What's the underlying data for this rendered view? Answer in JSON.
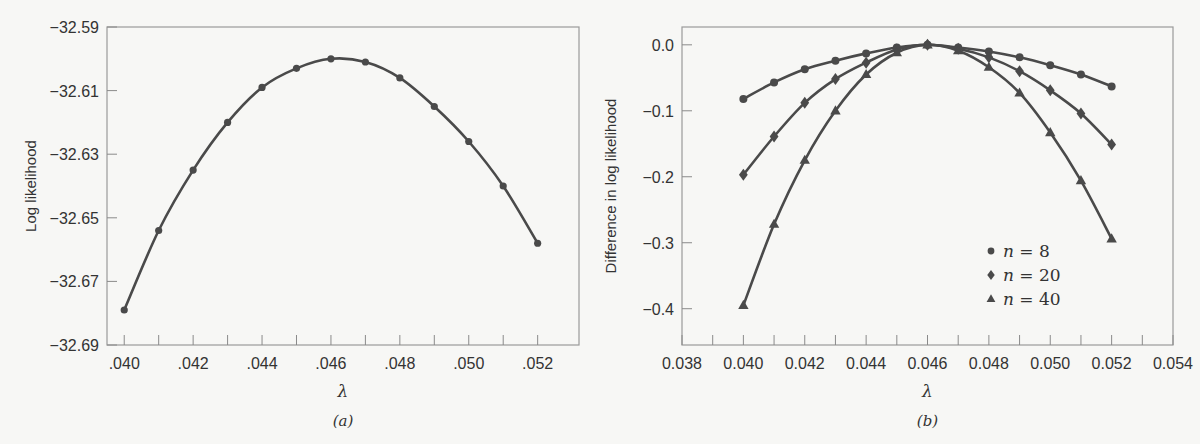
{
  "chart_data": [
    {
      "id": "a",
      "type": "line",
      "title": "",
      "caption": "(a)",
      "xlabel": "λ",
      "ylabel": "Log likelihood",
      "xlim": [
        0.0395,
        0.0532
      ],
      "ylim": [
        -32.69,
        -32.59
      ],
      "xticks": [
        0.04,
        0.041,
        0.042,
        0.043,
        0.044,
        0.045,
        0.046,
        0.047,
        0.048,
        0.049,
        0.05,
        0.051,
        0.052
      ],
      "xtick_labels": [
        ".040",
        "",
        ".042",
        "",
        ".044",
        "",
        ".046",
        "",
        ".048",
        "",
        ".050",
        "",
        ".052"
      ],
      "yticks": [
        -32.59,
        -32.61,
        -32.63,
        -32.65,
        -32.67,
        -32.69
      ],
      "ytick_labels": [
        "−32.59",
        "−32.61",
        "−32.63",
        "−32.65",
        "−32.67",
        "−32.69"
      ],
      "grid": false,
      "x": [
        0.04,
        0.041,
        0.042,
        0.043,
        0.044,
        0.045,
        0.046,
        0.047,
        0.048,
        0.049,
        0.05,
        0.051,
        0.052
      ],
      "series": [
        {
          "name": "Log likelihood",
          "marker": "circle",
          "values": [
            -32.679,
            -32.654,
            -32.635,
            -32.62,
            -32.609,
            -32.603,
            -32.6,
            -32.601,
            -32.606,
            -32.615,
            -32.626,
            -32.64,
            -32.658
          ]
        }
      ]
    },
    {
      "id": "b",
      "type": "line",
      "title": "",
      "caption": "(b)",
      "xlabel": "λ",
      "ylabel": "Difference in log likelihood",
      "xlim": [
        0.038,
        0.054
      ],
      "ylim": [
        -0.455,
        0.027
      ],
      "xticks": [
        0.038,
        0.039,
        0.04,
        0.041,
        0.042,
        0.043,
        0.044,
        0.045,
        0.046,
        0.047,
        0.048,
        0.049,
        0.05,
        0.051,
        0.052,
        0.053,
        0.054
      ],
      "xtick_labels": [
        "0.038",
        "",
        "0.040",
        "",
        "0.042",
        "",
        "0.044",
        "",
        "0.046",
        "",
        "0.048",
        "",
        "0.050",
        "",
        "0.052",
        "",
        "0.054"
      ],
      "yticks": [
        0.0,
        -0.1,
        -0.2,
        -0.3,
        -0.4
      ],
      "ytick_labels": [
        "0.0",
        "−0.1",
        "−0.2",
        "−0.3",
        "−0.4"
      ],
      "grid": false,
      "legend_position": "lower-right-inside",
      "x": [
        0.04,
        0.041,
        0.042,
        0.043,
        0.044,
        0.045,
        0.046,
        0.047,
        0.048,
        0.049,
        0.05,
        0.051,
        0.052
      ],
      "series": [
        {
          "name": "n = 8",
          "n": "8",
          "marker": "circle",
          "values": [
            -0.082,
            -0.057,
            -0.037,
            -0.024,
            -0.013,
            -0.004,
            0.0,
            -0.004,
            -0.01,
            -0.019,
            -0.031,
            -0.045,
            -0.063
          ]
        },
        {
          "name": "n = 20",
          "n": "20",
          "marker": "diamond",
          "values": [
            -0.197,
            -0.139,
            -0.088,
            -0.052,
            -0.027,
            -0.007,
            0.0,
            -0.006,
            -0.019,
            -0.04,
            -0.069,
            -0.104,
            -0.151
          ]
        },
        {
          "name": "n = 40",
          "n": "40",
          "marker": "triangle",
          "values": [
            -0.395,
            -0.272,
            -0.175,
            -0.1,
            -0.045,
            -0.012,
            0.0,
            -0.009,
            -0.034,
            -0.073,
            -0.133,
            -0.206,
            -0.294
          ]
        }
      ]
    }
  ],
  "layout": {
    "a": {
      "left": 107,
      "right": 579,
      "top": 27,
      "bottom": 345
    },
    "b": {
      "left": 682,
      "right": 1173,
      "top": 27,
      "bottom": 345
    }
  },
  "legend": {
    "items": [
      {
        "var": "n",
        "eq": " = 8",
        "marker": "circle"
      },
      {
        "var": "n",
        "eq": " = 20",
        "marker": "diamond"
      },
      {
        "var": "n",
        "eq": " = 40",
        "marker": "triangle"
      }
    ]
  },
  "colors": {
    "line": "#4a4a4a",
    "axis": "#9a9a9a",
    "background": "#f7f7f5"
  }
}
